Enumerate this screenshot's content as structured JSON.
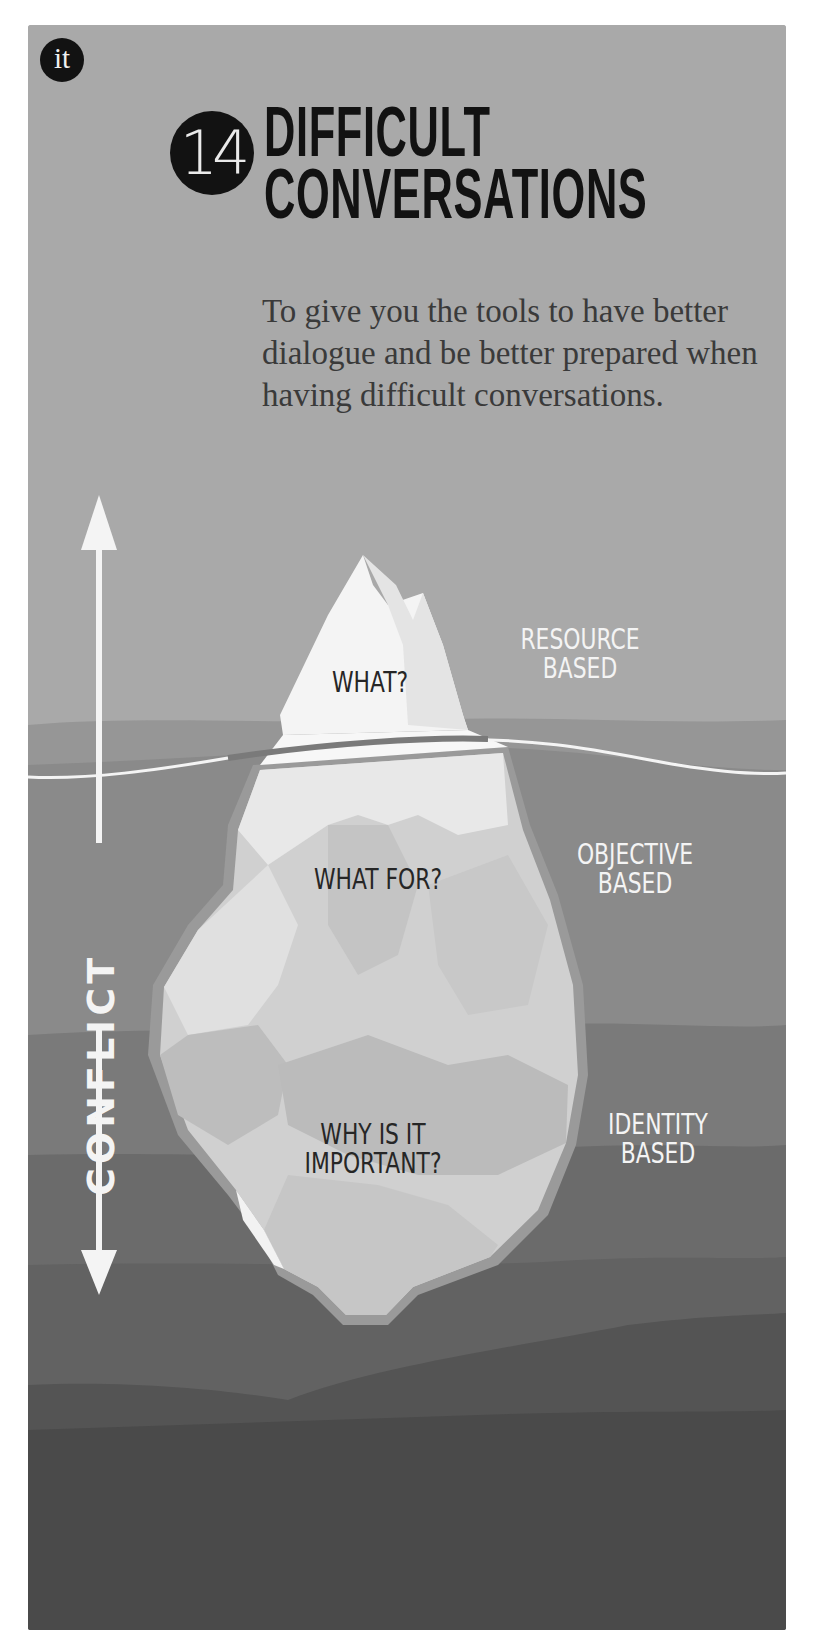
{
  "header": {
    "logo_text": "it",
    "number": "14",
    "title_line1": "DIFFICULT",
    "title_line2": "CONVERSATIONS",
    "subtitle": "To give you the tools to have better dialogue and be better prepared when having difficult conversations."
  },
  "diagram": {
    "axis_label": "CONFLICT",
    "iceberg_levels": [
      {
        "question": "WHAT?",
        "basis": "RESOURCE BASED"
      },
      {
        "question": "WHAT FOR?",
        "basis": "OBJECTIVE BASED"
      },
      {
        "question_line1": "WHY IS IT",
        "question_line2": "IMPORTANT?",
        "basis_line1": "IDENTITY",
        "basis_line2": "BASED"
      }
    ],
    "labels": {
      "resource_line1": "RESOURCE",
      "resource_line2": "BASED",
      "objective_line1": "OBJECTIVE",
      "objective_line2": "BASED",
      "identity_line1": "IDENTITY",
      "identity_line2": "BASED"
    }
  },
  "colors": {
    "sky": "#a9a9a9",
    "water_top": "#8e8e8e",
    "water_mid": "#777777",
    "water_deep": "#5f5f5f",
    "water_bottom": "#4a4a4a",
    "ice_light": "#f2f2f2",
    "ink": "#121212"
  }
}
